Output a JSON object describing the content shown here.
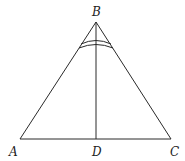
{
  "diagram": {
    "type": "geometry",
    "points": {
      "A": {
        "label": "A",
        "x": 20,
        "y": 139
      },
      "B": {
        "label": "B",
        "x": 96,
        "y": 22
      },
      "C": {
        "label": "C",
        "x": 171,
        "y": 139
      },
      "D": {
        "label": "D",
        "x": 96,
        "y": 139
      }
    },
    "segments": [
      "AB",
      "BC",
      "AC",
      "BD"
    ],
    "angle_marks": [
      {
        "vertex": "B",
        "arcs": 2,
        "spans": "ABC"
      }
    ]
  }
}
